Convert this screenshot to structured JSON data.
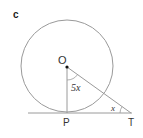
{
  "figure": {
    "part_label": "c",
    "center_label": "O",
    "tangent_point_label": "P",
    "external_point_label": "T",
    "angle_at_O": "5x",
    "angle_at_T": "x",
    "colors": {
      "line": "#9a9a9a",
      "text": "#333333",
      "point": "#111111"
    }
  }
}
